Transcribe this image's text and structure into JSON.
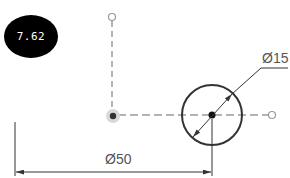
{
  "badge": {
    "value": "7.62",
    "bg_color": "#000000",
    "text_color": "#ffffff"
  },
  "drawing": {
    "hole_diameter_label": "Ø15",
    "distance_label": "Ø50",
    "line_color": "#333333",
    "centerline_color": "#9a9a9a",
    "text_color": "#555555"
  }
}
